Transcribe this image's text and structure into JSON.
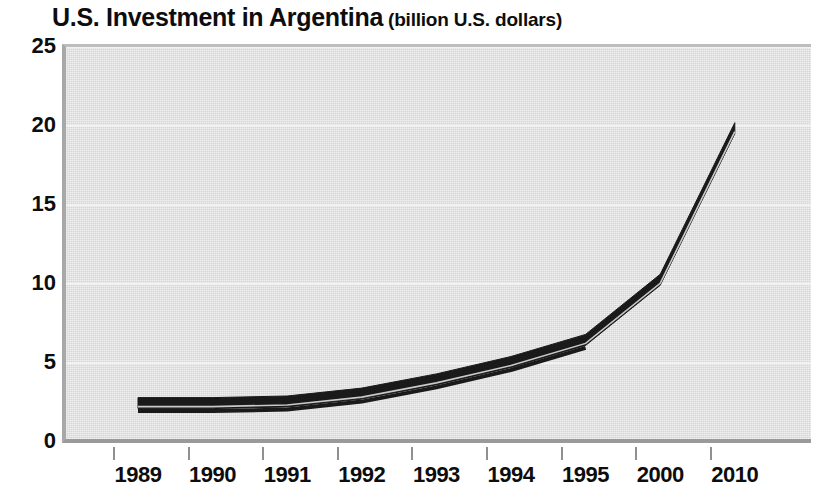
{
  "chart_data": {
    "type": "line",
    "title": "U.S. Investment in Argentina",
    "subtitle": "(billion U.S. dollars)",
    "xlabel": "",
    "ylabel": "",
    "categories": [
      "1989",
      "1990",
      "1991",
      "1992",
      "1993",
      "1994",
      "1995",
      "2000",
      "2010"
    ],
    "values": [
      2.4,
      2.4,
      2.5,
      3.0,
      3.9,
      5.0,
      6.4,
      10.2,
      19.8
    ],
    "series": [
      {
        "name": "U.S. Investment in Argentina",
        "values": [
          2.4,
          2.4,
          2.5,
          3.0,
          3.9,
          5.0,
          6.4,
          10.2,
          19.8
        ],
        "color": "#1a1a1a"
      }
    ],
    "ylim": [
      0,
      25
    ],
    "yticks": [
      0,
      5,
      10,
      15,
      20,
      25
    ],
    "ytick_labels": [
      "0",
      "5",
      "10",
      "15",
      "20",
      "25"
    ],
    "grid": true,
    "grid_color": "#f2f2f2",
    "legend": "none",
    "plot_background": "#d6d6d6",
    "line_style": "thick-band"
  },
  "title": {
    "main": "U.S. Investment in Argentina",
    "sub": "(billion U.S. dollars)"
  },
  "axes": {
    "y_labels": [
      "25",
      "20",
      "15",
      "10",
      "5",
      "0"
    ],
    "x_labels": [
      "1989",
      "1990",
      "1991",
      "1992",
      "1993",
      "1994",
      "1995",
      "2000",
      "2010"
    ]
  }
}
